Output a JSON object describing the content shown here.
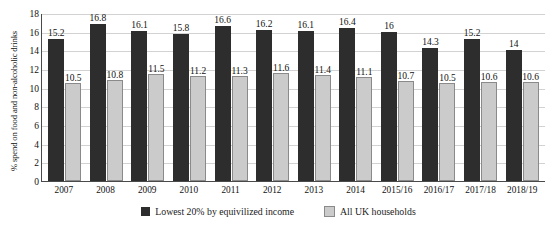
{
  "chart_data": {
    "type": "bar",
    "title": "",
    "xlabel": "",
    "ylabel": "% spend on food and non-alcoholic drinks",
    "ylim": [
      0,
      18
    ],
    "ytick_step": 2,
    "yticks": [
      18,
      16,
      14,
      12,
      10,
      8,
      6,
      4,
      2,
      0
    ],
    "grid": true,
    "legend_position": "bottom",
    "categories": [
      "2007",
      "2008",
      "2009",
      "2010",
      "2011",
      "2012",
      "2013",
      "2014",
      "2015/16",
      "2016/17",
      "2017/18",
      "2018/19"
    ],
    "series": [
      {
        "name": "Lowest 20% by equivilized income",
        "color": "#2d2d2d",
        "values": [
          15.2,
          16.8,
          16.1,
          15.8,
          16.6,
          16.2,
          16.1,
          16.4,
          16,
          14.3,
          15.2,
          14
        ],
        "labels": [
          "15.2",
          "16.8",
          "16.1",
          "15.8",
          "16.6",
          "16.2",
          "16.1",
          "16.4",
          "16",
          "14.3",
          "15.2",
          "14"
        ]
      },
      {
        "name": "All UK households",
        "color": "#cbcbcb",
        "values": [
          10.5,
          10.8,
          11.5,
          11.2,
          11.3,
          11.6,
          11.4,
          11.1,
          10.7,
          10.5,
          10.6,
          10.6
        ],
        "labels": [
          "10.5",
          "10.8",
          "11.5",
          "11.2",
          "11.3",
          "11.6",
          "11.4",
          "11.1",
          "10.7",
          "10.5",
          "10.6",
          "10.6"
        ]
      }
    ]
  }
}
